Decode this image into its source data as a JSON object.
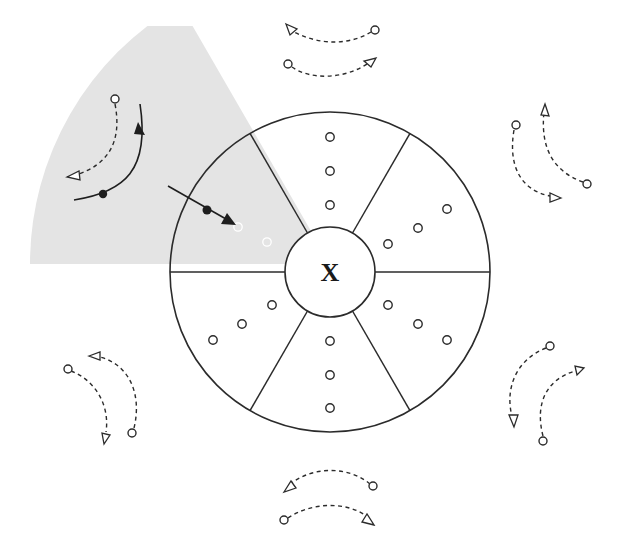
{
  "diagram": {
    "title": "",
    "center_label": "X",
    "colors": {
      "line": "#2b2b2b",
      "shaded_sector": "#e4e4e4",
      "background": "#ffffff"
    },
    "wheel": {
      "center": [
        330,
        272
      ],
      "outer_radius": 160,
      "inner_radius": 45,
      "sector_count": 6,
      "spoke_angles_deg": [
        0,
        60,
        120,
        180,
        240,
        300
      ]
    },
    "shaded_sector": {
      "description": "Shaded 60-degree wedge extending from the wheel's upper-left sector outward",
      "start_angle_deg": 120,
      "end_angle_deg": 180,
      "radius": 300
    },
    "sectors": [
      {
        "name": "top",
        "dots": 3
      },
      {
        "name": "upper-right",
        "dots": 3
      },
      {
        "name": "lower-right",
        "dots": 3
      },
      {
        "name": "bottom",
        "dots": 3
      },
      {
        "name": "lower-left",
        "dots": 3
      },
      {
        "name": "upper-left",
        "dots": 2,
        "note": "shaded; dots faint white, with solid arrow entering"
      }
    ],
    "outer_flows": [
      {
        "position": "top",
        "style": "dashed",
        "pairs": 2,
        "directions": [
          "right-to-left",
          "left-to-right"
        ]
      },
      {
        "position": "right-upper",
        "style": "dashed",
        "pairs": 2,
        "directions": [
          "downward",
          "upward"
        ]
      },
      {
        "position": "right-lower",
        "style": "dashed",
        "pairs": 2,
        "directions": [
          "downward",
          "upward"
        ]
      },
      {
        "position": "bottom",
        "style": "dashed",
        "pairs": 2,
        "directions": [
          "right-to-left",
          "left-to-right"
        ]
      },
      {
        "position": "left-lower",
        "style": "dashed",
        "pairs": 2,
        "directions": [
          "downward",
          "upward"
        ]
      },
      {
        "position": "left-upper (shaded)",
        "style": "mixed",
        "pairs": 2,
        "directions": [
          "dashed downward",
          "solid upward"
        ]
      }
    ],
    "entering_arrow": {
      "style": "solid",
      "marker": "filled dot",
      "target": "upper-left sector"
    }
  }
}
